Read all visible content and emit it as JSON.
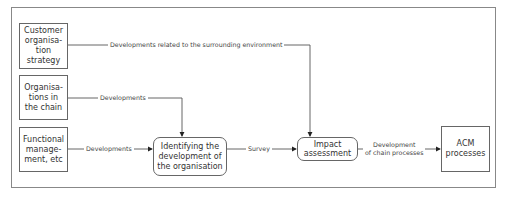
{
  "diagram": {
    "boxes": {
      "customer_strategy": "Customer\norganisa-\ntion\nstrategy",
      "organisations_chain": "Organisa-\ntions in\nthe chain",
      "functional_management": "Functional\nmanage-\nment, etc",
      "identifying_development": "Identifying the\ndevelopment of\nthe organisation",
      "impact_assessment": "Impact\nassessment",
      "acm_processes": "ACM\nprocesses"
    },
    "edges": {
      "surrounding_environment": "Developments related to the surrounding environment",
      "organisations_developments": "Developments",
      "functional_developments": "Developments",
      "survey": "Survey",
      "chain_processes": "Development\nof chain processes"
    }
  }
}
